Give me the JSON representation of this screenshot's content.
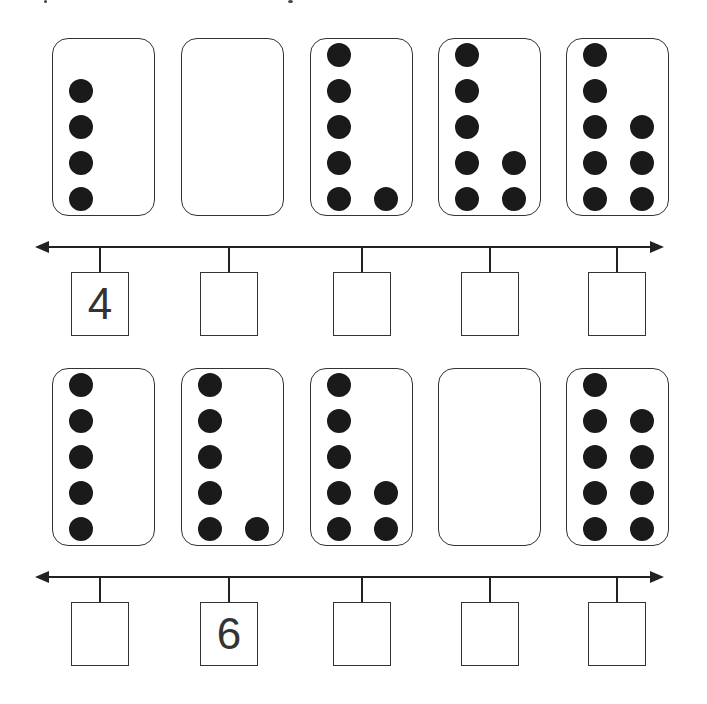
{
  "worksheet": {
    "rows": [
      {
        "cards": [
          {
            "dots": 4,
            "left": [
              0,
              0,
              0,
              0,
              0
            ],
            "layout": "left column bottom 4"
          },
          {
            "dots": 0
          },
          {
            "dots": 6
          },
          {
            "dots": 7
          },
          {
            "dots": 8
          }
        ],
        "answers": [
          "4",
          "",
          "",
          "",
          ""
        ]
      },
      {
        "cards": [
          {
            "dots": 5
          },
          {
            "dots": 6
          },
          {
            "dots": 7
          },
          {
            "dots": 0
          },
          {
            "dots": 9
          }
        ],
        "answers": [
          "",
          "6",
          "",
          "",
          ""
        ]
      }
    ]
  },
  "colors": {
    "dot": "#1a1a1a",
    "line": "#222222",
    "border": "#333333"
  }
}
